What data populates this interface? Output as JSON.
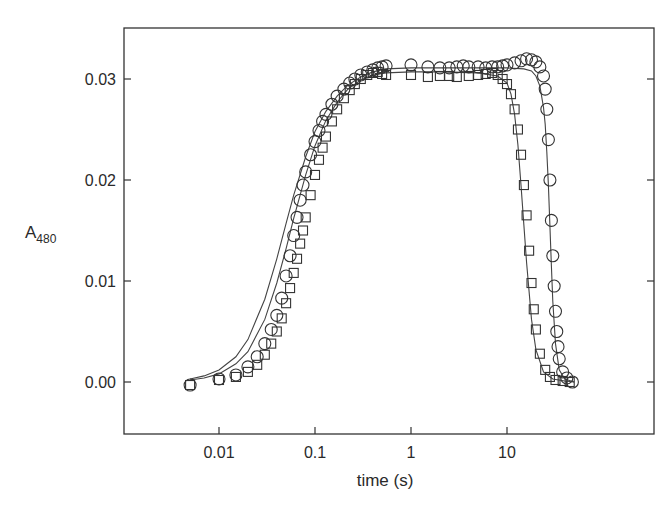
{
  "chart_data": {
    "type": "scatter",
    "title": "",
    "xlabel": "time (s)",
    "ylabel": "A480",
    "ylabel_main": "A",
    "ylabel_sub": "480",
    "xscale": "log",
    "xlim": [
      0.0009,
      70
    ],
    "ylim": [
      -0.005,
      0.035
    ],
    "x_ticks": [
      0.01,
      0.1,
      1,
      10
    ],
    "x_tick_labels": [
      "0.01",
      "0.1",
      "1",
      "10"
    ],
    "y_ticks": [
      0.0,
      0.01,
      0.02,
      0.03
    ],
    "y_tick_labels": [
      "0.00",
      "0.01",
      "0.02",
      "0.03"
    ],
    "grid": false,
    "legend": null,
    "series": [
      {
        "name": "circles",
        "marker": "circle",
        "x": [
          0.005,
          0.01,
          0.015,
          0.02,
          0.025,
          0.03,
          0.035,
          0.04,
          0.045,
          0.05,
          0.055,
          0.06,
          0.065,
          0.07,
          0.075,
          0.08,
          0.09,
          0.1,
          0.11,
          0.12,
          0.13,
          0.15,
          0.17,
          0.2,
          0.23,
          0.26,
          0.3,
          0.35,
          0.4,
          0.45,
          0.5,
          0.55,
          1.0,
          1.5,
          2.0,
          2.5,
          3.0,
          3.5,
          4.0,
          5.0,
          6.0,
          7.0,
          8.0,
          9.0,
          10.0,
          12.0,
          14.0,
          16.0,
          18.0,
          20.0,
          22.0,
          24.0,
          25.0,
          26.0,
          27.0,
          28.0,
          29.0,
          30.0,
          31.0,
          32.0,
          33.0,
          34.0,
          35.0,
          38.0,
          42.0,
          48.0
        ],
        "y": [
          -0.0003,
          0.0003,
          0.0007,
          0.0015,
          0.0025,
          0.0038,
          0.0052,
          0.0066,
          0.0083,
          0.0105,
          0.0125,
          0.0145,
          0.0163,
          0.018,
          0.0195,
          0.0208,
          0.0225,
          0.0238,
          0.0249,
          0.0258,
          0.0265,
          0.0275,
          0.0283,
          0.029,
          0.0296,
          0.03,
          0.0304,
          0.0307,
          0.0309,
          0.0311,
          0.0312,
          0.0313,
          0.0314,
          0.0312,
          0.0311,
          0.0311,
          0.0312,
          0.0313,
          0.0312,
          0.0312,
          0.0311,
          0.0312,
          0.0312,
          0.0313,
          0.0314,
          0.0316,
          0.0318,
          0.032,
          0.0319,
          0.0317,
          0.0312,
          0.0303,
          0.029,
          0.027,
          0.024,
          0.02,
          0.016,
          0.0125,
          0.0095,
          0.007,
          0.005,
          0.0035,
          0.0023,
          0.001,
          0.0004,
          0.0
        ]
      },
      {
        "name": "squares",
        "marker": "square",
        "x": [
          0.005,
          0.01,
          0.015,
          0.02,
          0.025,
          0.03,
          0.035,
          0.04,
          0.045,
          0.05,
          0.055,
          0.06,
          0.065,
          0.07,
          0.075,
          0.08,
          0.09,
          0.1,
          0.11,
          0.12,
          0.13,
          0.15,
          0.17,
          0.2,
          0.23,
          0.26,
          0.3,
          0.35,
          0.4,
          0.45,
          0.5,
          0.55,
          1.0,
          1.5,
          2.0,
          2.5,
          3.0,
          4.0,
          5.0,
          6.0,
          7.0,
          8.0,
          9.0,
          10.0,
          11.0,
          12.0,
          13.0,
          14.0,
          15.0,
          16.0,
          17.0,
          18.0,
          19.0,
          20.0,
          22.0,
          25.0,
          28.0,
          32.0,
          38.0,
          45.0
        ],
        "y": [
          -0.0003,
          0.0002,
          0.0005,
          0.001,
          0.0017,
          0.0027,
          0.0038,
          0.005,
          0.0063,
          0.0078,
          0.0093,
          0.0108,
          0.0122,
          0.0137,
          0.015,
          0.0163,
          0.0185,
          0.0205,
          0.022,
          0.0232,
          0.0243,
          0.0258,
          0.027,
          0.0281,
          0.0289,
          0.0295,
          0.03,
          0.0304,
          0.0306,
          0.0307,
          0.0305,
          0.0304,
          0.0304,
          0.0302,
          0.0303,
          0.0303,
          0.0302,
          0.0303,
          0.0304,
          0.0305,
          0.0306,
          0.0304,
          0.03,
          0.0295,
          0.0285,
          0.027,
          0.025,
          0.0225,
          0.0195,
          0.0165,
          0.013,
          0.0098,
          0.0072,
          0.0052,
          0.0028,
          0.0012,
          0.0005,
          0.0002,
          0.0001,
          0.0
        ]
      },
      {
        "name": "fit-circles",
        "marker": "line",
        "x": [
          0.005,
          0.007,
          0.01,
          0.015,
          0.02,
          0.03,
          0.04,
          0.05,
          0.06,
          0.08,
          0.1,
          0.13,
          0.17,
          0.22,
          0.3,
          0.4,
          0.55,
          1.0,
          2.0,
          5.0,
          10.0,
          15.0,
          18.0,
          20.0,
          22.0,
          24.0,
          25.0,
          26.0,
          27.0,
          28.0,
          29.0,
          30.0,
          32.0,
          35.0,
          40.0,
          50.0
        ],
        "y": [
          0.0003,
          0.0006,
          0.0012,
          0.0025,
          0.0042,
          0.0082,
          0.0122,
          0.0157,
          0.0185,
          0.0223,
          0.0248,
          0.0268,
          0.0283,
          0.0294,
          0.0302,
          0.0307,
          0.031,
          0.0311,
          0.0311,
          0.0311,
          0.0311,
          0.031,
          0.0308,
          0.0303,
          0.0293,
          0.0272,
          0.0255,
          0.0228,
          0.0195,
          0.0155,
          0.0115,
          0.008,
          0.0038,
          0.0012,
          0.0003,
          0.0
        ]
      },
      {
        "name": "fit-squares",
        "marker": "line",
        "x": [
          0.005,
          0.007,
          0.01,
          0.015,
          0.02,
          0.03,
          0.04,
          0.05,
          0.06,
          0.08,
          0.1,
          0.13,
          0.17,
          0.22,
          0.3,
          0.4,
          0.55,
          1.0,
          2.0,
          5.0,
          8.0,
          10.0,
          11.0,
          12.0,
          13.0,
          14.0,
          15.0,
          16.0,
          18.0,
          20.0,
          24.0,
          30.0,
          40.0,
          50.0
        ],
        "y": [
          0.0002,
          0.0004,
          0.0008,
          0.0018,
          0.003,
          0.0062,
          0.0098,
          0.0132,
          0.0162,
          0.0205,
          0.0234,
          0.0259,
          0.0277,
          0.029,
          0.0299,
          0.0304,
          0.0306,
          0.0307,
          0.0307,
          0.0306,
          0.0303,
          0.0296,
          0.0285,
          0.0265,
          0.0235,
          0.0195,
          0.0155,
          0.0118,
          0.0062,
          0.0032,
          0.001,
          0.0003,
          0.0001,
          0.0
        ]
      }
    ]
  }
}
